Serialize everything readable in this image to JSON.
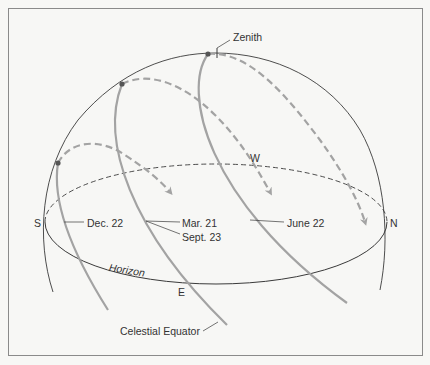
{
  "diagram": {
    "labels": {
      "zenith": "Zenith",
      "south": "S",
      "north": "N",
      "east": "E",
      "west": "W",
      "horizon": "Horizon",
      "dec22": "Dec. 22",
      "mar21": "Mar. 21",
      "sept23": "Sept. 23",
      "june22": "June 22",
      "celestial_equator": "Celestial Equator"
    },
    "paths": [
      {
        "name": "December 22 (winter solstice)",
        "label": "Dec. 22"
      },
      {
        "name": "March 21 / September 23 (equinoxes) — celestial equator",
        "label": "Mar. 21 / Sept. 23"
      },
      {
        "name": "June 22 (summer solstice)",
        "label": "June 22"
      }
    ],
    "colors": {
      "background": "#f7f7f5",
      "frame": "#8a8a8a",
      "outline": "#3a3a3a",
      "sun_path": "#a3a3a3",
      "dot": "#555555",
      "text": "#333333"
    }
  }
}
